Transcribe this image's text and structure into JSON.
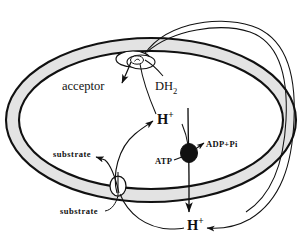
{
  "figure": {
    "background_color": "#ffffff",
    "membrane_fill": "#e3e3e3",
    "stroke_color": "#111111"
  },
  "labels": {
    "acceptor": "acceptor",
    "dh2_base": "DH",
    "dh2_sub": "2",
    "proton_inner": "H",
    "proton_inner_charge": "+",
    "proton_outer": "H",
    "proton_outer_charge": "+",
    "atp": "ATP",
    "adp_pi": "ADP+Pi",
    "substrate_inner": "substrate",
    "substrate_outer": "substrate"
  },
  "elements": {
    "membrane": "lipid-bilayer-ellipse",
    "respiratory_complex": "dehydrogenase-complex",
    "atp_synthase": "atp-synthase-particle",
    "substrate_transporter": "substrate-carrier-pore"
  }
}
